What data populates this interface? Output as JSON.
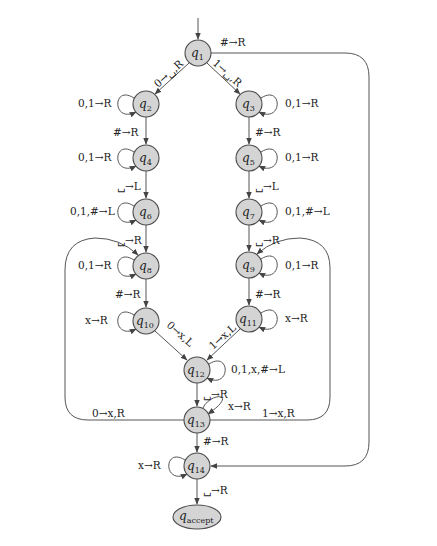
{
  "diagram": {
    "start_state": "q1",
    "states": [
      {
        "id": "q1",
        "label": "q",
        "sub": "1",
        "x": 198,
        "y": 53
      },
      {
        "id": "q2",
        "label": "q",
        "sub": "2",
        "x": 146,
        "y": 104
      },
      {
        "id": "q3",
        "label": "q",
        "sub": "3",
        "x": 249,
        "y": 104
      },
      {
        "id": "q4",
        "label": "q",
        "sub": "4",
        "x": 146,
        "y": 158
      },
      {
        "id": "q5",
        "label": "q",
        "sub": "5",
        "x": 249,
        "y": 158
      },
      {
        "id": "q6",
        "label": "q",
        "sub": "6",
        "x": 146,
        "y": 212
      },
      {
        "id": "q7",
        "label": "q",
        "sub": "7",
        "x": 249,
        "y": 212
      },
      {
        "id": "q8",
        "label": "q",
        "sub": "8",
        "x": 146,
        "y": 266
      },
      {
        "id": "q9",
        "label": "q",
        "sub": "9",
        "x": 249,
        "y": 265
      },
      {
        "id": "q10",
        "label": "q",
        "sub": "10",
        "x": 146,
        "y": 321
      },
      {
        "id": "q11",
        "label": "q",
        "sub": "11",
        "x": 249,
        "y": 319
      },
      {
        "id": "q12",
        "label": "q",
        "sub": "12",
        "x": 197,
        "y": 370
      },
      {
        "id": "q13",
        "label": "q",
        "sub": "13",
        "x": 197,
        "y": 420
      },
      {
        "id": "q14",
        "label": "q",
        "sub": "14",
        "x": 197,
        "y": 466
      },
      {
        "id": "qaccept",
        "label": "q",
        "sub": "accept",
        "x": 197,
        "y": 517
      }
    ],
    "transitions": {
      "q1_q2": "0→␣,R",
      "q1_q3": "1→␣,R",
      "q1_q14": "#→R",
      "q2_loop": "0,1→R",
      "q3_loop": "0,1→R",
      "q2_q4": "#→R",
      "q3_q5": "#→R",
      "q4_loop": "0,1→R",
      "q5_loop": "0,1→R",
      "q4_q6": "␣→L",
      "q5_q7": "␣→L",
      "q6_loop": "0,1,#→L",
      "q7_loop": "0,1,#→L",
      "q6_q8": "␣→R",
      "q7_q9": "␣→R",
      "q8_loop": "0,1→R",
      "q9_loop": "0,1→R",
      "q8_q10": "#→R",
      "q9_q11": "#→R",
      "q10_loop": "x→R",
      "q11_loop": "x→R",
      "q10_q12": "0→x,L",
      "q11_q12": "1→x,L",
      "q12_loop": "0,1,x,#→L",
      "q12_q13": "␣→R",
      "q13_loop": "x→R",
      "q13_q8": "0→x,R",
      "q13_q9": "1→x,R",
      "q13_q14": "#→R",
      "q14_loop": "x→R",
      "q14_qaccept": "␣→R"
    }
  }
}
